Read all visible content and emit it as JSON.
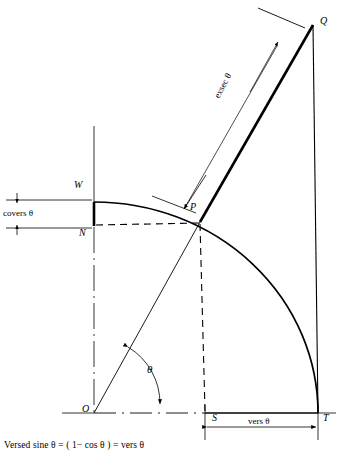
{
  "figure": {
    "name": "versed-sine-geometry-diagram",
    "caption": "Versed sine θ = ( 1− cos θ ) = vers θ",
    "stroke_color": "#000000",
    "background": "#ffffff"
  },
  "points": {
    "O": {
      "label": "O",
      "x": 94,
      "y": 413,
      "desc": "origin-center-of-circle"
    },
    "P": {
      "label": "P",
      "x": 200,
      "y": 222,
      "desc": "point-on-arc"
    },
    "Q": {
      "label": "Q",
      "x": 313,
      "y": 25,
      "desc": "intersection-of-ray-and-tangent"
    },
    "T": {
      "label": "T",
      "x": 318,
      "y": 413,
      "desc": "arc-end-on-horizontal-axis"
    },
    "S": {
      "label": "S",
      "x": 205,
      "y": 413,
      "desc": "foot-of-perpendicular-from-P"
    },
    "W": {
      "label": "W",
      "x": 94,
      "y": 202,
      "desc": "arc-top-on-vertical-axis"
    },
    "N": {
      "label": "N",
      "x": 94,
      "y": 225,
      "desc": "foot-of-horizontal-from-P-on-vertical-axis"
    }
  },
  "annotations": {
    "exsec": {
      "label": "exsec θ",
      "segment": "PQ",
      "desc": "external-secant-dimension"
    },
    "vers": {
      "label": "vers θ",
      "segment": "ST",
      "desc": "versed-sine-dimension"
    },
    "covers": {
      "label": "covers θ",
      "segment": "WN",
      "desc": "coversed-sine-dimension"
    },
    "theta": {
      "label": "θ",
      "desc": "angle-at-origin-between-OT-and-OQ"
    }
  },
  "geometry": {
    "arc": {
      "center_x": 94,
      "center_y": 413,
      "radius": 224,
      "desc": "quarter-circle-arc-from-W-to-T"
    },
    "angle_degrees": 62
  }
}
